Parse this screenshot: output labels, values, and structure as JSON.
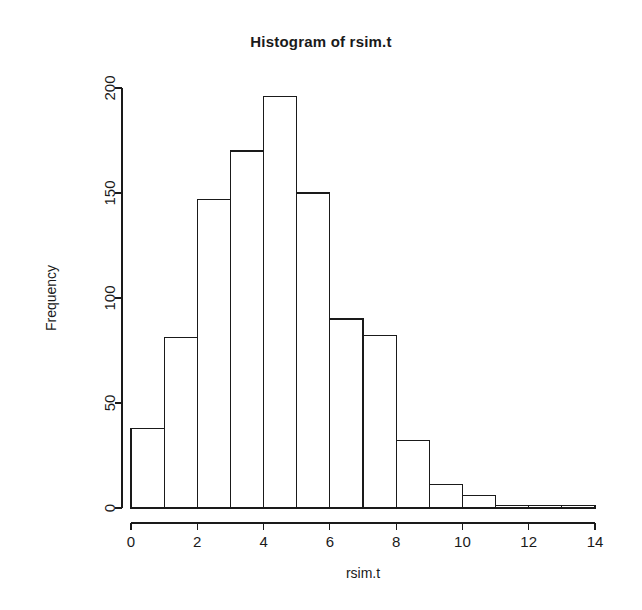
{
  "chart_data": {
    "type": "bar",
    "title": "Histogram of rsim.t",
    "xlabel": "rsim.t",
    "ylabel": "Frequency",
    "categories": [
      "0-1",
      "1-2",
      "2-3",
      "3-4",
      "4-5",
      "5-6",
      "6-7",
      "7-8",
      "8-9",
      "9-10",
      "10-11",
      "11-12",
      "12-13",
      "13-14"
    ],
    "bin_edges": [
      0,
      1,
      2,
      3,
      4,
      5,
      6,
      7,
      8,
      9,
      10,
      11,
      12,
      13,
      14
    ],
    "values": [
      38,
      81,
      147,
      170,
      196,
      150,
      90,
      82,
      32,
      11,
      6,
      1,
      1,
      1
    ],
    "xlim": [
      0,
      14
    ],
    "ylim": [
      0,
      200
    ],
    "xticks": [
      0,
      2,
      4,
      6,
      8,
      10,
      12,
      14
    ],
    "xtick_labels": [
      "0",
      "2",
      "4",
      "6",
      "8",
      "10",
      "12",
      "14"
    ],
    "yticks": [
      0,
      50,
      100,
      150,
      200
    ],
    "ytick_labels": [
      "0",
      "50",
      "100",
      "150",
      "200"
    ],
    "grid": false,
    "legend": null,
    "bar_fill": "#ffffff",
    "bar_stroke": "#1a1a1a",
    "background": "#ffffff"
  }
}
